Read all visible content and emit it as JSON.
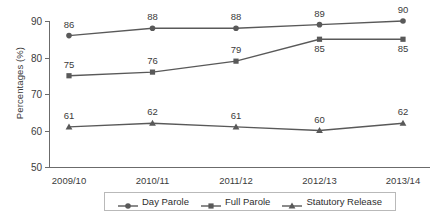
{
  "chart_data": {
    "type": "line",
    "title": "",
    "xlabel": "",
    "ylabel": "Percentages (%)",
    "ylim": [
      50,
      90
    ],
    "yticks": [
      50,
      60,
      70,
      80,
      90
    ],
    "grid": false,
    "legend_position": "bottom",
    "categories": [
      "2009/10",
      "2010/11",
      "2011/12",
      "2012/13",
      "2013/14"
    ],
    "series": [
      {
        "name": "Day Parole",
        "marker": "circle",
        "color": "#595959",
        "values": [
          86,
          88,
          88,
          89,
          90
        ],
        "label_positions": [
          "above",
          "above",
          "above",
          "above",
          "above"
        ]
      },
      {
        "name": "Full Parole",
        "marker": "square",
        "color": "#595959",
        "values": [
          75,
          76,
          79,
          85,
          85
        ],
        "label_positions": [
          "above",
          "above",
          "above",
          "below",
          "below"
        ]
      },
      {
        "name": "Statutory Release",
        "marker": "triangle",
        "color": "#595959",
        "values": [
          61,
          62,
          61,
          60,
          62
        ],
        "label_positions": [
          "above",
          "above",
          "above",
          "above",
          "above"
        ]
      }
    ]
  },
  "axis": {
    "y_title": "Percentages (%)",
    "y_tick_labels": [
      "90",
      "80",
      "70",
      "60",
      "50"
    ],
    "x_tick_labels": [
      "2009/10",
      "2010/11",
      "2011/12",
      "2012/13",
      "2013/14"
    ]
  },
  "legend": {
    "items": [
      {
        "label": "Day Parole",
        "marker": "circle-marker"
      },
      {
        "label": "Full Parole",
        "marker": "square-marker"
      },
      {
        "label": "Statutory Release",
        "marker": "triangle-marker"
      }
    ]
  },
  "colors": {
    "line": "#595959",
    "axis": "#6b6b6b",
    "text": "#3b3b3b",
    "legend_border": "#b9b9b9",
    "background": "#ffffff"
  }
}
